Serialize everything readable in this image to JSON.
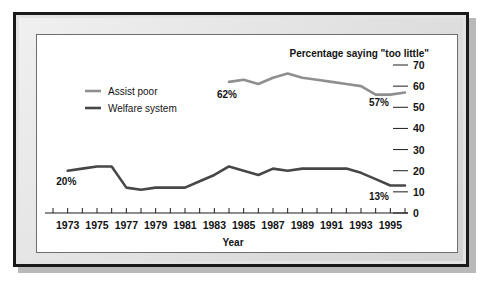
{
  "chart_data": {
    "type": "line",
    "title": "Percentage saying \"too little\"",
    "xlabel": "Year",
    "ylabel": "",
    "xlim": [
      1972,
      1996
    ],
    "ylim": [
      0,
      70
    ],
    "ytick_step": 10,
    "yticks": [
      0,
      10,
      20,
      30,
      40,
      50,
      60,
      70
    ],
    "ytick_labels": [
      "0",
      "10",
      "20",
      "30",
      "40",
      "50",
      "60",
      "70"
    ],
    "xticks": [
      1973,
      1975,
      1977,
      1979,
      1981,
      1983,
      1985,
      1987,
      1989,
      1991,
      1993,
      1995
    ],
    "xtick_labels": [
      "1973",
      "1975",
      "1977",
      "1979",
      "1981",
      "1983",
      "1985",
      "1987",
      "1989",
      "1991",
      "1993",
      "1995"
    ],
    "x_minor_ticks": [
      1972,
      1973,
      1974,
      1975,
      1976,
      1977,
      1978,
      1979,
      1980,
      1981,
      1982,
      1983,
      1984,
      1985,
      1986,
      1987,
      1988,
      1989,
      1990,
      1991,
      1992,
      1993,
      1994,
      1995,
      1996
    ],
    "grid": false,
    "legend_position": "upper-left",
    "series": [
      {
        "name": "Assist poor",
        "color": "#8f8f8f",
        "linewidth": 2.6,
        "x": [
          1984,
          1985,
          1986,
          1987,
          1988,
          1989,
          1990,
          1991,
          1992,
          1993,
          1994,
          1995,
          1996
        ],
        "values": [
          62,
          63,
          61,
          64,
          66,
          64,
          63,
          62,
          61,
          60,
          56,
          56,
          57
        ]
      },
      {
        "name": "Welfare system",
        "color": "#474747",
        "linewidth": 2.6,
        "x": [
          1973,
          1974,
          1975,
          1976,
          1977,
          1978,
          1979,
          1980,
          1981,
          1982,
          1983,
          1984,
          1985,
          1986,
          1987,
          1988,
          1989,
          1990,
          1991,
          1992,
          1993,
          1994,
          1995,
          1996
        ],
        "values": [
          20,
          21,
          22,
          22,
          12,
          11,
          12,
          12,
          12,
          15,
          18,
          22,
          20,
          18,
          21,
          20,
          21,
          21,
          21,
          21,
          19,
          16,
          13,
          13
        ]
      }
    ],
    "annotations": [
      {
        "text": "20%",
        "x": 1974,
        "y": 20,
        "dx": -16,
        "dy": 14,
        "anchor": "middle"
      },
      {
        "text": "62%",
        "x": 1984,
        "y": 62,
        "dx": -2,
        "dy": 16,
        "anchor": "middle"
      },
      {
        "text": "57%",
        "x": 1996,
        "y": 57,
        "dx": -16,
        "dy": 14,
        "anchor": "end"
      },
      {
        "text": "13%",
        "x": 1996,
        "y": 13,
        "dx": -16,
        "dy": 14,
        "anchor": "end"
      }
    ]
  }
}
